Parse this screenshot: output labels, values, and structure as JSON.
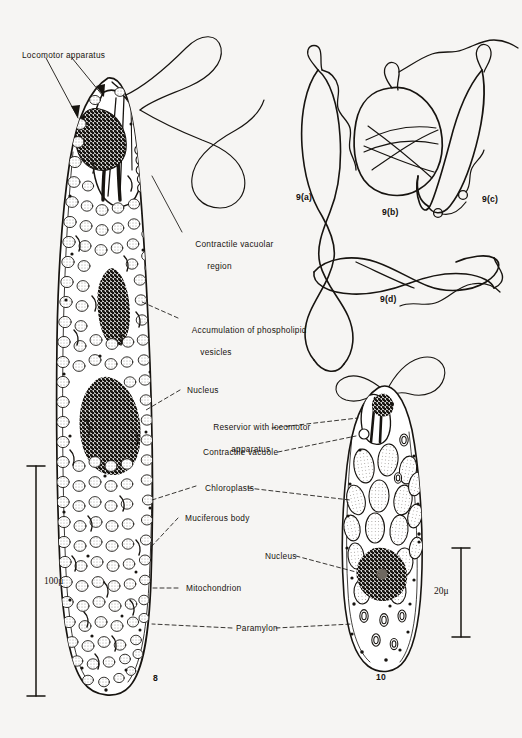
{
  "plate": {
    "background_color": "#f6f5f3",
    "ink_color": "#171410",
    "width": 522,
    "height": 738
  },
  "figure8": {
    "number": "8",
    "scale_bar": {
      "value": "100",
      "unit": "μ",
      "text": "100μ"
    },
    "labels": [
      {
        "id": "locomotor-apparatus",
        "text": "Locomotor apparatus"
      },
      {
        "id": "contractile-vacuolar-region",
        "line1": "Contractile vacuolar",
        "line2": "region"
      },
      {
        "id": "accumulation-phospholipid",
        "line1": "Accumulation of phospholipid",
        "line2": "vesicles"
      },
      {
        "id": "nucleus",
        "text": "Nucleus"
      },
      {
        "id": "muciferous-body",
        "text": "Muciferous body"
      },
      {
        "id": "mitochondrion",
        "text": "Mitochondrion"
      }
    ]
  },
  "figure9": {
    "panels": [
      {
        "id": "9a",
        "label": "9(a)"
      },
      {
        "id": "9b",
        "label": "9(b)"
      },
      {
        "id": "9c",
        "label": "9(c)"
      },
      {
        "id": "9d",
        "label": "9(d)"
      }
    ]
  },
  "figure10": {
    "number": "10",
    "scale_bar": {
      "value": "20",
      "unit": "μ",
      "text": "20μ"
    },
    "labels": [
      {
        "id": "reservoir-with-locomotor-apparatus",
        "line1": "Reservior with locomotor",
        "line2": "apparatus"
      },
      {
        "id": "contractile-vacuole",
        "text": "Contractile vacuole"
      },
      {
        "id": "chloroplasts",
        "text": "Chloroplasts"
      },
      {
        "id": "nucleus-10",
        "text": "Nucleus"
      },
      {
        "id": "paramylon",
        "text": "Paramylon"
      }
    ]
  }
}
